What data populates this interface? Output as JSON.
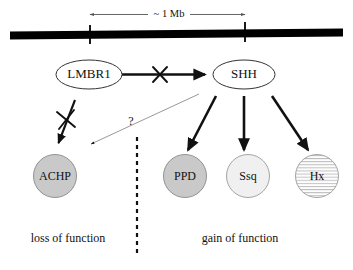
{
  "figure": {
    "background_color": "#ffffff",
    "width": 353,
    "height": 270
  },
  "scale": {
    "label": "~ 1 Mb",
    "left_tick_x": 90,
    "right_tick_x": 245,
    "line_color": "#555555"
  },
  "chromosome": {
    "name": "chromosome-bar",
    "color": "#000000",
    "ticks": 2
  },
  "genes": {
    "lmbr1": {
      "label": "LMBR1",
      "shape": "ellipse",
      "fill": "#ffffff",
      "stroke": "#333333"
    },
    "shh": {
      "label": "SHH",
      "shape": "ellipse",
      "fill": "#ffffff",
      "stroke": "#333333"
    }
  },
  "phenotypes": [
    {
      "id": "achp",
      "label": "ACHP",
      "shape": "circle",
      "fill": "#c9c9c9",
      "pattern": "solid",
      "group": "loss of function"
    },
    {
      "id": "ppd",
      "label": "PPD",
      "shape": "circle",
      "fill": "#c9c9c9",
      "pattern": "solid",
      "group": "gain of function"
    },
    {
      "id": "ssq",
      "label": "Ssq",
      "shape": "circle",
      "fill": "#f0f0f0",
      "pattern": "solid",
      "group": "gain of function"
    },
    {
      "id": "hx",
      "label": "Hx",
      "shape": "circle",
      "fill": "#fbfbfb",
      "pattern": "horizontal-hatch",
      "group": "gain of function"
    }
  ],
  "edges": {
    "lmbr1_to_shh": {
      "name": "lmbr1-to-shh-arrow",
      "blocked": true,
      "cross_mark": "X"
    },
    "lmbr1_to_achp": {
      "name": "lmbr1-to-achp-arrow",
      "blocked": true,
      "cross_mark": "X"
    },
    "shh_to_achp": {
      "name": "shh-to-achp-question-arrow",
      "label": "?",
      "style": "thin-gray"
    },
    "shh_to_ppd": {
      "name": "shh-to-ppd-arrow",
      "blocked": false
    },
    "shh_to_ssq": {
      "name": "shh-to-ssq-arrow",
      "blocked": false
    },
    "shh_to_hx": {
      "name": "shh-to-hx-arrow",
      "blocked": false
    }
  },
  "captions": {
    "left": "loss of function",
    "right": "gain of function"
  },
  "divider": {
    "name": "function-divider",
    "style": "dashed",
    "x": 137
  }
}
